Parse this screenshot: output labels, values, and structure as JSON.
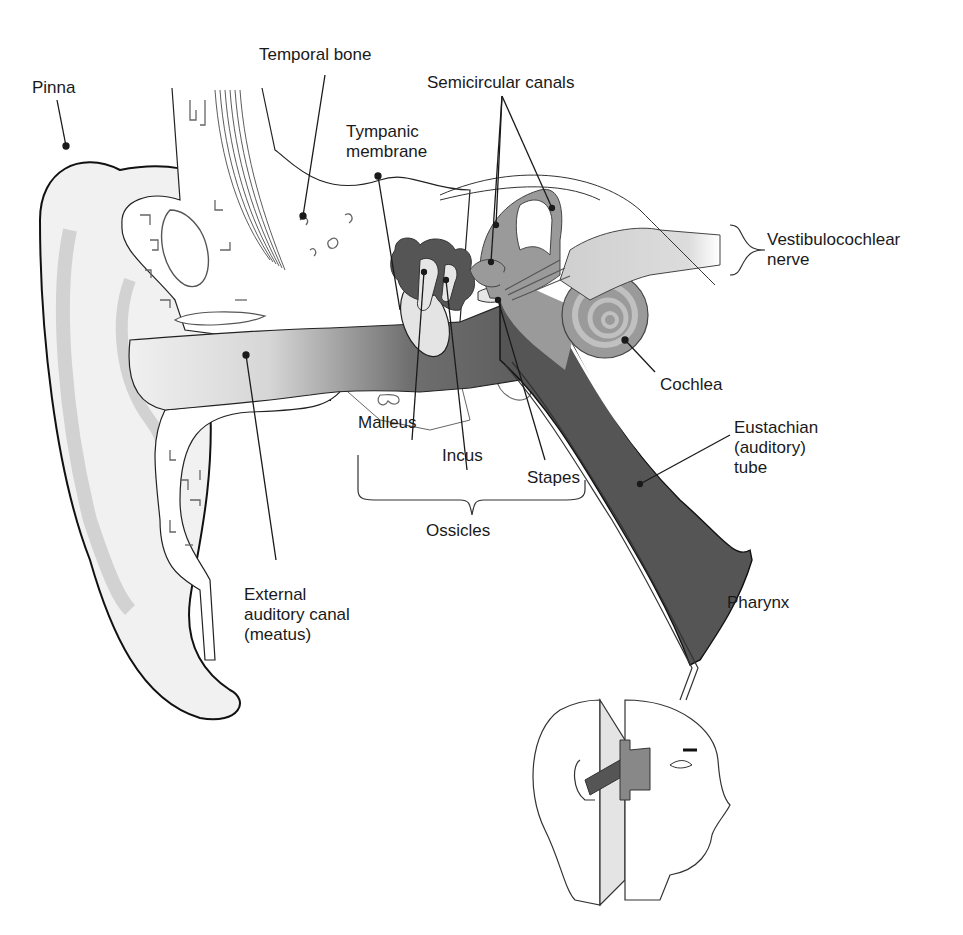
{
  "figure": {
    "colors": {
      "canal_light": "#ececec",
      "canal_dark": "#6e6e6e",
      "tube": "#575757",
      "ossicles": "#5a5a5a",
      "inner_ear": "#9a9a9a",
      "bone_fill": "#ffffff",
      "line": "#1a1a1a"
    }
  },
  "labels": {
    "pinna": "Pinna",
    "temporal_bone": "Temporal bone",
    "semicircular_canals": "Semicircular canals",
    "tympanic_membrane": "Tympanic\nmembrane",
    "vestibulocochlear_nerve": "Vestibulocochlear\nnerve",
    "cochlea": "Cochlea",
    "eustachian_tube": "Eustachian\n(auditory)\ntube",
    "malleus": "Malleus",
    "incus": "Incus",
    "stapes": "Stapes",
    "ossicles": "Ossicles",
    "pharynx": "Pharynx",
    "external_canal": "External\nauditory canal\n(meatus)"
  }
}
